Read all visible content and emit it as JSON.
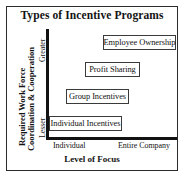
{
  "chart_data": {
    "type": "scatter",
    "title": "Types of Incentive Programs",
    "xlabel": "Level of Focus",
    "ylabel": "Required Work Force Coordination & Cooperation",
    "x_tick_labels": [
      "Individual",
      "Entire Company"
    ],
    "y_tick_labels": [
      "Lesser",
      "Greater"
    ],
    "grid": false,
    "legend": "none",
    "categories": [
      "Individual Incentives",
      "Group Incentives",
      "Profit Sharing",
      "Employee Ownership"
    ],
    "points": [
      {
        "label": "Individual Incentives",
        "x": 1,
        "y": 1
      },
      {
        "label": "Group Incentives",
        "x": 2,
        "y": 2
      },
      {
        "label": "Profit Sharing",
        "x": 3,
        "y": 3
      },
      {
        "label": "Employee Ownership",
        "x": 4,
        "y": 4
      }
    ],
    "xlim": [
      0,
      5
    ],
    "ylim": [
      0,
      5
    ]
  },
  "figure": {
    "title": "Types of Incentive Programs",
    "frame_color": "#2b2b2b",
    "axis_color": "#121212",
    "background": "#ffffff"
  },
  "y_axis": {
    "title_line1": "Required Work Force",
    "title_line2": "Coordination & Cooperation",
    "tick_high": "Greater",
    "tick_low": "Lesser"
  },
  "x_axis": {
    "title": "Level of Focus",
    "tick_left": "Individual",
    "tick_right": "Entire Company"
  },
  "nodes": {
    "employee_ownership": "Employee Ownership",
    "profit_sharing": "Profit Sharing",
    "group_incentives": "Group Incentives",
    "individual_incentives": "Individual Incentives"
  }
}
